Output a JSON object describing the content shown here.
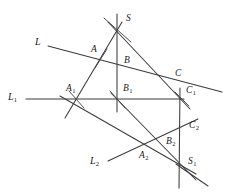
{
  "figure": {
    "background_color": "#ffffff",
    "stroke_color": "#3b3b3b",
    "label_color": "#1a1a1a",
    "width": 234,
    "height": 196
  },
  "point_labels": [
    {
      "name": "S",
      "base": "S",
      "sub": "",
      "x": 126,
      "y": 14
    },
    {
      "name": "A",
      "base": "A",
      "sub": "",
      "x": 91,
      "y": 45
    },
    {
      "name": "B",
      "base": "B",
      "sub": "",
      "x": 124,
      "y": 56
    },
    {
      "name": "C",
      "base": "C",
      "sub": "",
      "x": 175,
      "y": 69
    },
    {
      "name": "A1",
      "base": "A",
      "sub": "1",
      "x": 66,
      "y": 84
    },
    {
      "name": "B1",
      "base": "B",
      "sub": "1",
      "x": 123,
      "y": 84
    },
    {
      "name": "C1",
      "base": "C",
      "sub": "1",
      "x": 186,
      "y": 86
    },
    {
      "name": "C2",
      "base": "C",
      "sub": "2",
      "x": 189,
      "y": 121
    },
    {
      "name": "B2",
      "base": "B",
      "sub": "2",
      "x": 166,
      "y": 137
    },
    {
      "name": "A2",
      "base": "A",
      "sub": "2",
      "x": 139,
      "y": 151
    },
    {
      "name": "S1",
      "base": "S",
      "sub": "1",
      "x": 188,
      "y": 157
    }
  ],
  "line_labels": [
    {
      "name": "L",
      "base": "L",
      "sub": "",
      "x": 35,
      "y": 37
    },
    {
      "name": "L1",
      "base": "L",
      "sub": "1",
      "x": 8,
      "y": 92
    },
    {
      "name": "L2",
      "base": "L",
      "sub": "2",
      "x": 90,
      "y": 156
    }
  ],
  "geometry": {
    "lines": [
      {
        "name": "line-L-through-A-B-C",
        "x1": 48,
        "y1": 46,
        "x2": 222,
        "y2": 92
      },
      {
        "name": "line-L1-through-A1-B1-C1",
        "x1": 26,
        "y1": 99,
        "x2": 184,
        "y2": 99
      },
      {
        "name": "line-L2-through-A2-B2-C2",
        "x1": 108,
        "y1": 161,
        "x2": 198,
        "y2": 119
      },
      {
        "name": "ray-S-A-A1-extended",
        "x1": 122,
        "y1": 22,
        "x2": 65,
        "y2": 118
      },
      {
        "name": "ray-S-B-B1-extended",
        "x1": 117,
        "y1": 14,
        "x2": 117,
        "y2": 112
      },
      {
        "name": "ray-S-C-C1-extended",
        "x1": 108,
        "y1": 22,
        "x2": 190,
        "y2": 109
      },
      {
        "name": "ray-A1-A2-S1",
        "x1": 60,
        "y1": 96,
        "x2": 196,
        "y2": 174
      },
      {
        "name": "ray-B1-B2-S1-extended",
        "x1": 111,
        "y1": 93,
        "x2": 196,
        "y2": 180
      },
      {
        "name": "ray-C1-C2-S1-extended",
        "x1": 180,
        "y1": 88,
        "x2": 179,
        "y2": 188
      },
      {
        "name": "ray-S1-lower-right-tail",
        "x1": 176,
        "y1": 164,
        "x2": 208,
        "y2": 186
      },
      {
        "name": "tick-through-A1",
        "x1": 69,
        "y1": 91,
        "x2": 84,
        "y2": 108
      },
      {
        "name": "tick-through-B1",
        "x1": 110,
        "y1": 91,
        "x2": 125,
        "y2": 108
      },
      {
        "name": "tick-through-C1",
        "x1": 175,
        "y1": 92,
        "x2": 189,
        "y2": 106
      },
      {
        "name": "tick-through-S",
        "x1": 104,
        "y1": 18,
        "x2": 131,
        "y2": 42
      },
      {
        "name": "tick-through-A",
        "x1": 95,
        "y1": 68,
        "x2": 107,
        "y2": 49
      }
    ]
  }
}
